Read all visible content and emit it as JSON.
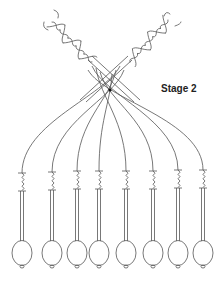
{
  "diagram": {
    "title": "Stage 2",
    "colors": {
      "line": "#555555",
      "text": "#222222",
      "background": "#ffffff"
    },
    "bobbin_count": 8,
    "bobbins": [
      {
        "x": 22,
        "spring_top": 173
      },
      {
        "x": 52,
        "spring_top": 172
      },
      {
        "x": 77,
        "spring_top": 171
      },
      {
        "x": 99,
        "spring_top": 171
      },
      {
        "x": 126,
        "spring_top": 171
      },
      {
        "x": 153,
        "spring_top": 171
      },
      {
        "x": 178,
        "spring_top": 170
      },
      {
        "x": 203,
        "spring_top": 170
      }
    ],
    "pin_dot": {
      "x": 110,
      "y": 90
    },
    "braids": [
      {
        "name": "left-plait",
        "direction": "upper-left"
      },
      {
        "name": "right-plait",
        "direction": "upper-right"
      }
    ]
  }
}
